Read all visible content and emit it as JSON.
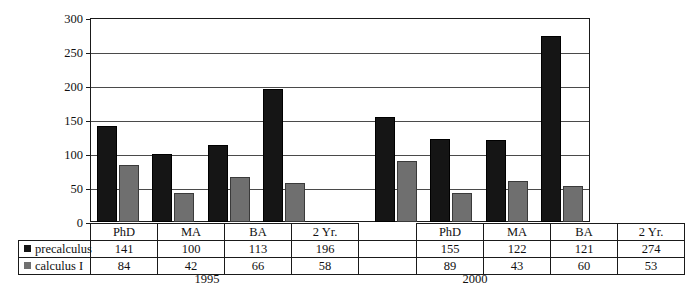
{
  "chart_data": {
    "type": "bar",
    "title": "",
    "xlabel": "",
    "ylabel": "",
    "ylim": [
      0,
      300
    ],
    "ytick_step": 50,
    "yticks": [
      300,
      250,
      200,
      150,
      100,
      50,
      0
    ],
    "grid": true,
    "legend_position": "bottom-left",
    "group_labels": [
      "1995",
      "2000"
    ],
    "categories": [
      "PhD",
      "MA",
      "BA",
      "2 Yr.",
      "PhD",
      "MA",
      "BA",
      "2 Yr."
    ],
    "series": [
      {
        "name": "precalculus",
        "color": "#151515",
        "values": [
          141,
          100,
          113,
          196,
          155,
          122,
          121,
          274
        ]
      },
      {
        "name": "calculus I",
        "color": "#6f6f6f",
        "values": [
          84,
          42,
          66,
          58,
          89,
          43,
          60,
          53
        ]
      }
    ],
    "groups": [
      {
        "label": "1995",
        "categories": [
          "PhD",
          "MA",
          "BA",
          "2 Yr."
        ],
        "precalculus": [
          141,
          100,
          113,
          196
        ],
        "calculus_I": [
          84,
          42,
          66,
          58
        ]
      },
      {
        "label": "2000",
        "categories": [
          "PhD",
          "MA",
          "BA",
          "2 Yr."
        ],
        "precalculus": [
          155,
          122,
          121,
          274
        ],
        "calculus_I": [
          89,
          43,
          60,
          53
        ]
      }
    ]
  },
  "axis": {
    "labels": [
      "300",
      "250",
      "200",
      "150",
      "100",
      "50",
      "0"
    ]
  },
  "table": {
    "header": [
      "PhD",
      "MA",
      "BA",
      "2 Yr.",
      "",
      "PhD",
      "MA",
      "BA",
      "2 Yr."
    ],
    "rows": [
      {
        "legend": "precalculus",
        "swatch": "black-square-icon",
        "cells": [
          "141",
          "100",
          "113",
          "196",
          "",
          "155",
          "122",
          "121",
          "274"
        ]
      },
      {
        "legend": "calculus I",
        "swatch": "gray-square-icon",
        "cells": [
          "84",
          "42",
          "66",
          "58",
          "",
          "89",
          "43",
          "60",
          "53"
        ]
      }
    ]
  },
  "captions": {
    "left": "1995",
    "right": "2000"
  }
}
